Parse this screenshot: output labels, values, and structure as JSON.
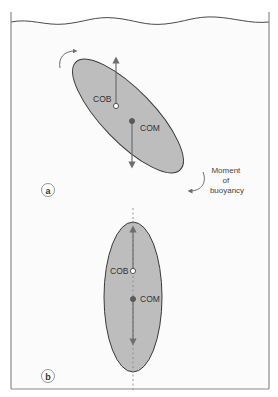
{
  "figure": {
    "type": "physics-diagram",
    "colors": {
      "background": "#ffffff",
      "water_fill": "#fbfbfb",
      "frame": "#8a8a8a",
      "body_fill": "#bdbdbd",
      "body_outline": "#3a3a3a",
      "arrow": "#6e6e6e",
      "com_dot": "#5a5a5a",
      "cob_dot": "#ffffff"
    }
  },
  "panel_a": {
    "label": "a",
    "state": "tilted",
    "cob_label": "COB",
    "com_label": "COM",
    "moment_label_line1": "Moment",
    "moment_label_line2": "of",
    "moment_label_line3": "buoyancy"
  },
  "panel_b": {
    "label": "b",
    "state": "upright (aligned)",
    "cob_label": "COB",
    "com_label": "COM"
  }
}
